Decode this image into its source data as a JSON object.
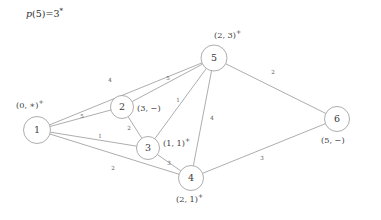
{
  "title": {
    "expr_var": "p",
    "expr_arg": "(5)",
    "expr_eq": "=3",
    "expr_star": "*",
    "full": "p(5) =3*"
  },
  "graph": {
    "type": "labeled-network-diagram",
    "stroke_color": "#8a8a8a",
    "text_color": "#3a3a3a",
    "nodes": [
      {
        "id": "1",
        "label": "1",
        "cx": 37,
        "cy": 130,
        "r": 13.5,
        "tag_text": "(0, ∗)",
        "tag_sup": "+",
        "tag_x": 16,
        "tag_y": 100,
        "tag_align": "left"
      },
      {
        "id": "2",
        "label": "2",
        "cx": 122,
        "cy": 107,
        "r": 11.5,
        "tag_text": "(3, −)",
        "tag_sup": "",
        "tag_x": 137,
        "tag_y": 103,
        "tag_align": "left"
      },
      {
        "id": "3",
        "label": "3",
        "cx": 148,
        "cy": 148,
        "r": 11.5,
        "tag_text": "(1, 1)",
        "tag_sup": "+",
        "tag_x": 163,
        "tag_y": 138,
        "tag_align": "left"
      },
      {
        "id": "4",
        "label": "4",
        "cx": 191,
        "cy": 178,
        "r": 12.5,
        "tag_text": "(2, 1)",
        "tag_sup": "+",
        "tag_x": 176,
        "tag_y": 194,
        "tag_align": "left"
      },
      {
        "id": "5",
        "label": "5",
        "cx": 214,
        "cy": 58,
        "r": 13.0,
        "tag_text": "(2, 3)",
        "tag_sup": "+",
        "tag_x": 214,
        "tag_y": 30,
        "tag_align": "left"
      },
      {
        "id": "6",
        "label": "6",
        "cx": 337,
        "cy": 119,
        "r": 12.5,
        "tag_text": "(5, −)",
        "tag_sup": "",
        "tag_x": 321,
        "tag_y": 135,
        "tag_align": "left"
      }
    ],
    "edges": [
      {
        "from": "1",
        "to": "5",
        "weight": "4",
        "wx": 110,
        "wy": 80
      },
      {
        "from": "1",
        "to": "2",
        "weight": "5",
        "wx": 82,
        "wy": 116
      },
      {
        "from": "1",
        "to": "3",
        "weight": "1",
        "wx": 100,
        "wy": 136
      },
      {
        "from": "1",
        "to": "4",
        "weight": "2",
        "wx": 113,
        "wy": 168
      },
      {
        "from": "2",
        "to": "5",
        "weight": "5",
        "wx": 168,
        "wy": 78
      },
      {
        "from": "2",
        "to": "3",
        "weight": "2",
        "wx": 129,
        "wy": 128
      },
      {
        "from": "3",
        "to": "5",
        "weight": "1",
        "wx": 178,
        "wy": 100
      },
      {
        "from": "3",
        "to": "4",
        "weight": "3",
        "wx": 169,
        "wy": 163
      },
      {
        "from": "5",
        "to": "4",
        "weight": "4",
        "wx": 212,
        "wy": 118
      },
      {
        "from": "5",
        "to": "6",
        "weight": "2",
        "wx": 273,
        "wy": 72
      },
      {
        "from": "4",
        "to": "6",
        "weight": "3",
        "wx": 262,
        "wy": 158
      }
    ]
  }
}
